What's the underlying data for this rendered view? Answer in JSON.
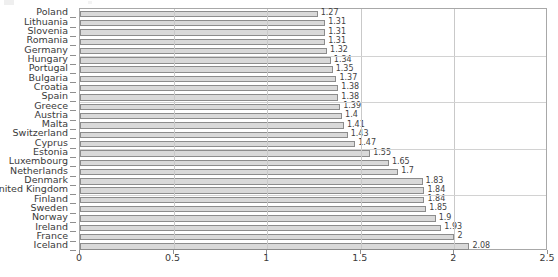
{
  "chart_data": {
    "type": "bar",
    "orientation": "horizontal",
    "title": "",
    "subtitle": "",
    "xlabel": "",
    "ylabel": "",
    "xlim": [
      0,
      2.5
    ],
    "xticks": [
      "0",
      "0.5",
      "1",
      "1.5",
      "2",
      "2.5"
    ],
    "xtick_values": [
      0,
      0.5,
      1,
      1.5,
      2,
      2.5
    ],
    "grid": true,
    "grid_axis": "x",
    "legend": null,
    "categories": [
      "Poland",
      "Lithuania",
      "Slovenia",
      "Romania",
      "Germany",
      "Hungary",
      "Portugal",
      "Bulgaria",
      "Croatia",
      "Spain",
      "Greece",
      "Austria",
      "Malta",
      "Switzerland",
      "Cyprus",
      "Estonia",
      "Luxembourg",
      "Netherlands",
      "Denmark",
      "United Kingdom",
      "Finland",
      "Sweden",
      "Norway",
      "Ireland",
      "France",
      "Iceland"
    ],
    "values": [
      1.27,
      1.31,
      1.31,
      1.31,
      1.32,
      1.34,
      1.35,
      1.37,
      1.38,
      1.38,
      1.39,
      1.4,
      1.41,
      1.43,
      1.47,
      1.55,
      1.65,
      1.7,
      1.83,
      1.84,
      1.84,
      1.85,
      1.9,
      1.93,
      2,
      2.08
    ],
    "value_labels": [
      "1.27",
      "1.31",
      "1.31",
      "1.31",
      "1.32",
      "1.34",
      "1.35",
      "1.37",
      "1.38",
      "1.38",
      "1.39",
      "1.4",
      "1.41",
      "1.43",
      "1.47",
      "1.55",
      "1.65",
      "1.7",
      "1.83",
      "1.84",
      "1.84",
      "1.85",
      "1.9",
      "1.93",
      "2",
      "2.08"
    ],
    "colors": {
      "bar_fill": "#d9d9d9",
      "bar_edge": "#8c8c8c",
      "gridline": "#c9c9c9",
      "axis": "#a8a8a8",
      "text": "#3a3a3a",
      "background": "#ffffff"
    }
  }
}
